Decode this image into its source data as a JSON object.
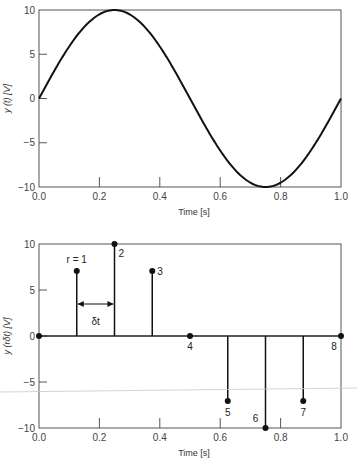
{
  "chart_data": [
    {
      "type": "line",
      "title": "",
      "xlabel": "Time [s]",
      "ylabel": "y (t) [V]",
      "xlim": [
        0.0,
        1.0
      ],
      "ylim": [
        -10,
        10
      ],
      "x_ticks": [
        "0.0",
        "0.2",
        "0.4",
        "0.6",
        "0.8",
        "1.0"
      ],
      "y_ticks": [
        "10",
        "5",
        "0",
        "-5",
        "-10"
      ],
      "grid": false,
      "series": [
        {
          "name": "y(t) = 10 sin(2πt)",
          "function": "10*sin(2*pi*t)",
          "amplitude": 10,
          "frequency_hz": 1,
          "x": [
            0,
            0.125,
            0.25,
            0.375,
            0.5,
            0.625,
            0.75,
            0.875,
            1.0
          ],
          "values": [
            0,
            7.07,
            10,
            7.07,
            0,
            -7.07,
            -10,
            -7.07,
            0
          ]
        }
      ]
    },
    {
      "type": "stem",
      "title": "",
      "xlabel": "Time [s]",
      "ylabel": "y (rδt) [V]",
      "xlim": [
        0.0,
        1.0
      ],
      "ylim": [
        -10,
        10
      ],
      "x_ticks": [
        "0.0",
        "0.2",
        "0.4",
        "0.6",
        "0.8",
        "1.0"
      ],
      "y_ticks": [
        "10",
        "5",
        "0",
        "-5",
        "-10"
      ],
      "grid": false,
      "series": [
        {
          "name": "samples",
          "x": [
            0,
            0.125,
            0.25,
            0.375,
            0.5,
            0.625,
            0.75,
            0.875,
            1.0
          ],
          "values": [
            0,
            7.07,
            10,
            7.07,
            0,
            -7.07,
            -10,
            -7.07,
            0
          ],
          "labels": [
            "",
            "r = 1",
            "2",
            "3",
            "4",
            "5",
            "6",
            "7",
            "8"
          ]
        }
      ],
      "annotations": {
        "delta_label": "δt",
        "from_x": 0.125,
        "to_x": 0.25,
        "at_y": 1.2
      }
    }
  ]
}
